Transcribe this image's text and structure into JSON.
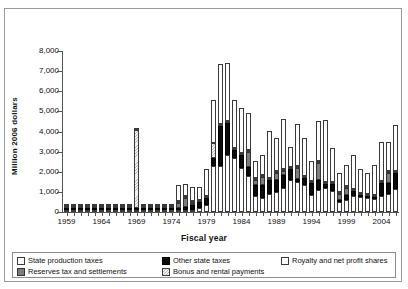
{
  "axes": {
    "ylabel": "Million 2006 dollars",
    "xlabel": "Fiscal year",
    "yticks": [
      "8,000",
      "7,000",
      "6,000",
      "5,000",
      "4,000",
      "3,000",
      "2,000",
      "1,000",
      "0"
    ],
    "xticks": [
      "1959",
      "1964",
      "1969",
      "1974",
      "1979",
      "1984",
      "1989",
      "1994",
      "1999",
      "2004"
    ]
  },
  "legend": {
    "items": [
      {
        "label": "State production taxes",
        "key": "state_production_taxes",
        "swatch": "dotted-white"
      },
      {
        "label": "Other state taxes",
        "key": "other_state_taxes",
        "swatch": "solid-black"
      },
      {
        "label": "Royalty and net profit shares",
        "key": "royalty_and_net_profit_shares",
        "swatch": "solid-white"
      },
      {
        "label": "Reserves tax and settlements",
        "key": "reserves_tax_and_settlements",
        "swatch": "solid-gray"
      },
      {
        "label": "Bonus and rental payments",
        "key": "bonus_and_rental_payments",
        "swatch": "hatched-light"
      }
    ]
  },
  "chart_data": {
    "type": "bar",
    "stacked": true,
    "title": "",
    "xlabel": "Fiscal year",
    "ylabel": "Million 2006 dollars",
    "ylim": [
      0,
      8000
    ],
    "ytick_step": 1000,
    "grid": false,
    "legend_position": "bottom",
    "colors": {
      "state_production_taxes": "#ffffff",
      "other_state_taxes": "#0b0b0b",
      "royalty_and_net_profit_shares": "#ffffff",
      "reserves_tax_and_settlements": "#7d7d7d",
      "bonus_and_rental_payments": "#f0f0f0"
    },
    "stack_order": [
      "state_production_taxes",
      "other_state_taxes",
      "reserves_tax_and_settlements",
      "bonus_and_rental_payments",
      "royalty_and_net_profit_shares"
    ],
    "categories": [
      1959,
      1960,
      1961,
      1962,
      1963,
      1964,
      1965,
      1966,
      1967,
      1968,
      1969,
      1970,
      1971,
      1972,
      1973,
      1974,
      1975,
      1976,
      1977,
      1978,
      1979,
      1980,
      1981,
      1982,
      1983,
      1984,
      1985,
      1986,
      1987,
      1988,
      1989,
      1990,
      1991,
      1992,
      1993,
      1994,
      1995,
      1996,
      1997,
      1998,
      1999,
      2000,
      2001,
      2002,
      2003,
      2004,
      2005,
      2006
    ],
    "series": [
      {
        "name": "State production taxes",
        "key": "state_production_taxes",
        "values": [
          5,
          5,
          10,
          10,
          15,
          20,
          25,
          25,
          30,
          30,
          30,
          35,
          35,
          40,
          45,
          50,
          60,
          80,
          120,
          180,
          340,
          2280,
          2300,
          2850,
          2700,
          2200,
          1800,
          800,
          700,
          900,
          1000,
          1200,
          1600,
          1500,
          1350,
          850,
          1100,
          1200,
          1050,
          500,
          600,
          800,
          750,
          700,
          650,
          800,
          900,
          1150
        ]
      },
      {
        "name": "Other state taxes",
        "key": "other_state_taxes",
        "values": [
          10,
          10,
          10,
          15,
          15,
          20,
          20,
          20,
          25,
          25,
          25,
          25,
          25,
          30,
          30,
          35,
          60,
          140,
          220,
          300,
          380,
          380,
          1990,
          1580,
          390,
          640,
          420,
          560,
          630,
          700,
          600,
          620,
          520,
          160,
          320,
          580,
          480,
          190,
          350,
          90,
          230,
          260,
          100,
          120,
          120,
          640,
          530,
          790
        ]
      },
      {
        "name": "Reserves tax and settlements",
        "key": "reserves_tax_and_settlements",
        "values": [
          0,
          0,
          0,
          0,
          0,
          0,
          0,
          0,
          0,
          0,
          0,
          0,
          0,
          0,
          0,
          0,
          260,
          480,
          100,
          0,
          0,
          0,
          0,
          0,
          0,
          0,
          750,
          240,
          400,
          0,
          320,
          230,
          0,
          510,
          0,
          0,
          870,
          0,
          0,
          290,
          340,
          0,
          0,
          0,
          0,
          0,
          520,
          0
        ]
      },
      {
        "name": "Bonus and rental payments",
        "key": "bonus_and_rental_payments",
        "values": [
          10,
          10,
          10,
          10,
          20,
          20,
          20,
          20,
          30,
          30,
          3900,
          30,
          30,
          30,
          40,
          40,
          40,
          40,
          50,
          60,
          70,
          790,
          60,
          70,
          60,
          60,
          60,
          60,
          50,
          50,
          50,
          50,
          50,
          60,
          60,
          60,
          50,
          60,
          50,
          40,
          50,
          50,
          40,
          40,
          40,
          50,
          60,
          60
        ]
      },
      {
        "name": "Royalty and net profit shares",
        "key": "royalty_and_net_profit_shares",
        "values": [
          15,
          20,
          20,
          25,
          30,
          30,
          30,
          35,
          35,
          40,
          40,
          40,
          45,
          45,
          50,
          60,
          780,
          560,
          700,
          670,
          1340,
          2130,
          2980,
          2860,
          2400,
          2230,
          1850,
          830,
          1000,
          2330,
          1640,
          2490,
          1000,
          2100,
          1900,
          1020,
          1960,
          3100,
          1680,
          970,
          1080,
          1660,
          1180,
          1010,
          1450,
          1960,
          1430,
          2270
        ]
      }
    ]
  }
}
